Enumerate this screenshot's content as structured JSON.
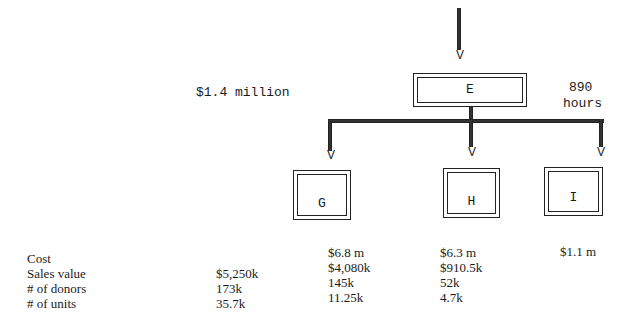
{
  "diagram": {
    "top_node": {
      "label": "E",
      "left_annotation": "$1.4 million",
      "right_annotation_line1": "890",
      "right_annotation_line2": "hours"
    },
    "children": [
      {
        "label": "G"
      },
      {
        "label": "H"
      },
      {
        "label": "I"
      }
    ]
  },
  "table": {
    "row_labels": [
      "Cost",
      "Sales value",
      "# of donors",
      "# of units"
    ],
    "columns": [
      {
        "name": "E",
        "values": [
          "",
          "$5,250k",
          "173k",
          "35.7k"
        ]
      },
      {
        "name": "G",
        "values": [
          "$6.8 m",
          "$4,080k",
          "145k",
          "11.25k"
        ]
      },
      {
        "name": "H",
        "values": [
          "$6.3 m",
          "$910.5k",
          "52k",
          "4.7k"
        ]
      },
      {
        "name": "I",
        "values": [
          "$1.1 m",
          "",
          "",
          ""
        ]
      }
    ]
  }
}
